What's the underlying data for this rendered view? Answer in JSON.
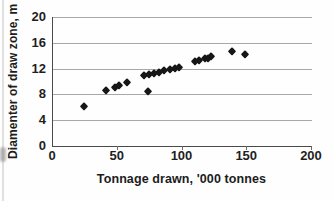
{
  "chart_data": {
    "type": "scatter",
    "title": "",
    "xlabel": "Tonnage drawn, '000 tonnes",
    "ylabel": "Diamenter of draw zone, m",
    "xlim": [
      0,
      200
    ],
    "ylim": [
      0,
      20
    ],
    "xticks": [
      0,
      50,
      100,
      150,
      200
    ],
    "yticks": [
      0,
      4,
      8,
      12,
      16,
      20
    ],
    "grid": "horizontal-gridlines-on",
    "legend": "none",
    "marker_shape": "diamond",
    "marker_color": "#161616",
    "gridline_color": "#a8a8a8",
    "axis_color": "#4a4a4a",
    "points": [
      [
        24,
        6.2
      ],
      [
        41,
        8.7
      ],
      [
        48,
        9.2
      ],
      [
        51,
        9.5
      ],
      [
        57,
        10.0
      ],
      [
        70,
        11.0
      ],
      [
        73,
        8.5
      ],
      [
        74,
        11.2
      ],
      [
        78,
        11.3
      ],
      [
        82,
        11.5
      ],
      [
        86,
        11.8
      ],
      [
        90,
        12.0
      ],
      [
        94,
        12.1
      ],
      [
        97,
        12.2
      ],
      [
        110,
        13.2
      ],
      [
        113,
        13.3
      ],
      [
        117,
        13.6
      ],
      [
        120,
        13.7
      ],
      [
        122,
        13.9
      ],
      [
        138,
        14.7
      ],
      [
        148,
        14.2
      ]
    ]
  }
}
